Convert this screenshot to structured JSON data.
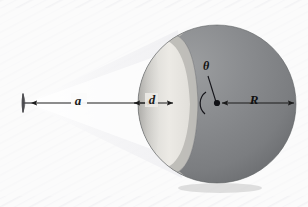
{
  "figure": {
    "domain": "diagram",
    "kind": "physics-optics-illustration",
    "caption_header": "PROBLEM 18",
    "width": 308,
    "height": 207
  },
  "background": {
    "page_color": "#fbfbfb",
    "texture_color": "#f2f2f4",
    "plate_color": "#f7f7f8"
  },
  "labels": {
    "distance_a": "a",
    "cap_depth_d": "d",
    "radius_R": "R",
    "angle_theta": "θ"
  },
  "label_positions": {
    "distance_a": {
      "x": 78,
      "y": 101
    },
    "cap_depth_d": {
      "x": 151,
      "y": 101
    },
    "radius_R": {
      "x": 253,
      "y": 101
    },
    "angle_theta": {
      "x": 206,
      "y": 66
    }
  },
  "geometry": {
    "source": {
      "x": 24,
      "y": 103,
      "half_height": 9,
      "stem_length": 5
    },
    "sphere": {
      "center_x": 217,
      "center_y": 104,
      "radius": 79
    },
    "cap_plane_x": 159,
    "axis_y": 103,
    "angle_vertex": {
      "x": 217,
      "y": 104
    },
    "angle_arc_radius": 13
  },
  "colors": {
    "sphere_dark": "#888a8c",
    "sphere_dark_shadow": "#6e7073",
    "sphere_edge": "#5d5f62",
    "cap_light": "#e7e6e2",
    "cap_mid": "#cfcecb",
    "cap_rim": "#b9b8b5",
    "cap_inner_shadow": "#a8a8a6",
    "light_cone": "#f0f0f2",
    "ink": "#1c1c1c",
    "source_gray": "#7b7b7e"
  },
  "annotations": {
    "arrow_a": {
      "from_x": 30,
      "to_x": 155,
      "y": 103,
      "double_headed": true
    },
    "arrow_d": {
      "from_x": 134,
      "to_x": 172,
      "y": 103,
      "double_headed": true
    },
    "arrow_R": {
      "from_x": 222,
      "to_x": 293,
      "y": 103,
      "double_headed": true
    },
    "theta_leader": {
      "from_x": 217,
      "from_y": 104,
      "to_x": 207,
      "to_y": 74
    }
  }
}
